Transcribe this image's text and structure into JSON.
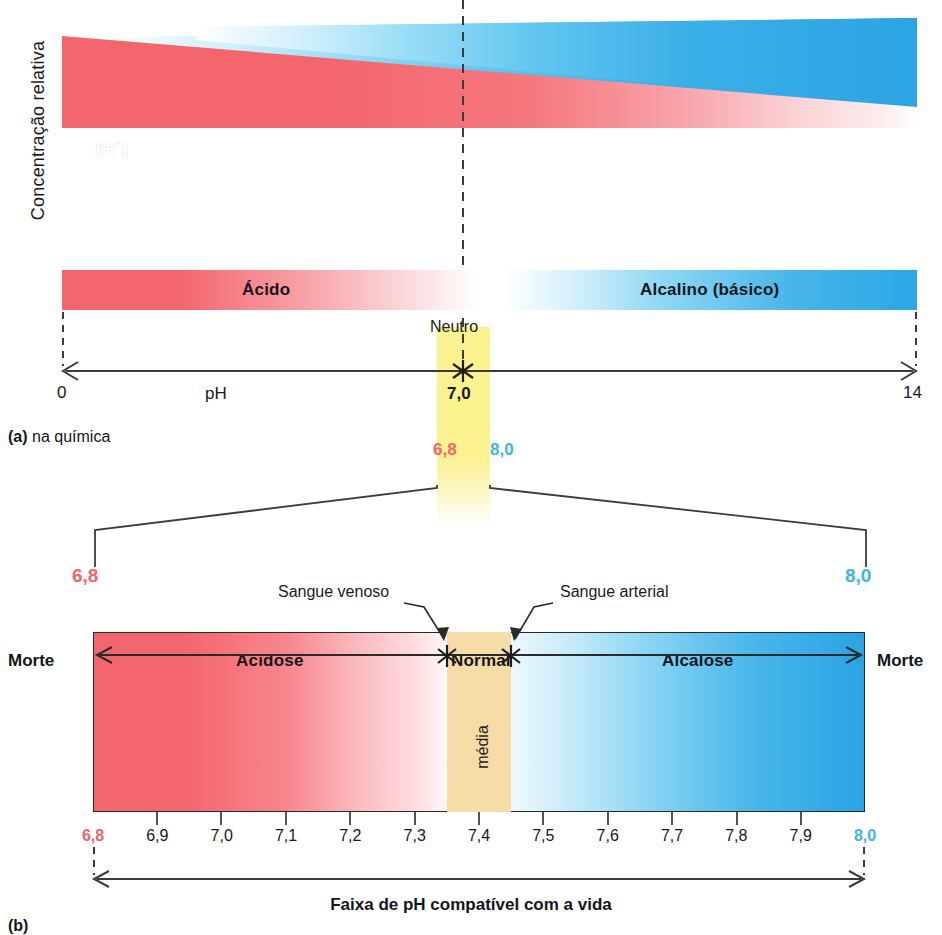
{
  "figure": {
    "y_axis_label": "Concentração relativa",
    "panel_a": {
      "caption_marker": "(a)",
      "caption_text": "na química",
      "ion_acid": "[H",
      "ion_acid_sup": "+",
      "ion_acid_close": "]",
      "ion_base": "[OH",
      "ion_base_sup": "−",
      "ion_base_close": "]",
      "band_acid": "Ácido",
      "band_alkaline": "Alcalino (básico)",
      "neutral_label": "Neutro",
      "axis_name": "pH",
      "axis_min": "0",
      "axis_max": "14",
      "neutral_value": "7,0",
      "callout_low": "6,8",
      "callout_high": "8,0"
    },
    "panel_b": {
      "caption_marker": "(b)",
      "expand_low": "6,8",
      "expand_high": "8,0",
      "label_venous": "Sangue venoso",
      "label_arterial": "Sangue arterial",
      "zone_acidosis": "Acidose",
      "zone_normal": "Normal",
      "zone_alkalosis": "Alcalose",
      "mean_label": "média",
      "death_left": "Morte",
      "death_right": "Morte",
      "range_caption": "Faixa de pH compatível com a vida",
      "scale_min": "6,8",
      "scale_max": "8,0",
      "scale_ticks": [
        "6,8",
        "6,9",
        "7,0",
        "7,1",
        "7,2",
        "7,3",
        "7,4",
        "7,5",
        "7,6",
        "7,7",
        "7,8",
        "7,9",
        "8,0"
      ]
    }
  },
  "colors": {
    "acid_red": "#f4666e",
    "alkaline_blue": "#2ba4e4",
    "neutral_white": "#ffffff",
    "highlight_yellow": "#fcf28f",
    "normal_band": "#f6dda8",
    "label_red": "#f4626c",
    "label_blue": "#3fb3e8",
    "line": "#2a2a2a"
  },
  "chart_data": {
    "type": "area",
    "xlabel": "pH",
    "ylabel": "Concentração relativa",
    "xlim": [
      0,
      14
    ],
    "grid": false,
    "legend": [
      "[H+]",
      "[OH-]"
    ],
    "series": [
      {
        "name": "[H+]",
        "x": [
          0,
          14
        ],
        "values": [
          100,
          8
        ],
        "color": "#f4666e",
        "note": "cunha vermelha decrescente: concentração de íons hidrogênio cai conforme o pH sobe"
      },
      {
        "name": "[OH-]",
        "x": [
          0,
          14
        ],
        "values": [
          8,
          100
        ],
        "color": "#2ba4e4",
        "note": "cunha azul crescente: concentração de íons hidroxila sobe conforme o pH sobe"
      }
    ],
    "annotations": [
      {
        "text": "Neutro",
        "x": 7.0
      },
      {
        "text": "Ácido",
        "x_range": [
          0,
          7
        ]
      },
      {
        "text": "Alcalino (básico)",
        "x_range": [
          7,
          14
        ]
      },
      {
        "text": "6,8",
        "x": 6.8
      },
      {
        "text": "8,0",
        "x": 8.0
      }
    ],
    "subplot_b": {
      "type": "area",
      "xlabel": "pH",
      "xlim": [
        6.8,
        8.0
      ],
      "tick_step": 0.1,
      "ticks": [
        6.8,
        6.9,
        7.0,
        7.1,
        7.2,
        7.3,
        7.4,
        7.5,
        7.6,
        7.7,
        7.8,
        7.9,
        8.0
      ],
      "regions": [
        {
          "label": "Acidose",
          "range": [
            6.8,
            7.35
          ],
          "color": "#f4666e"
        },
        {
          "label": "Normal",
          "range": [
            7.35,
            7.45
          ],
          "color": "#f6dda8"
        },
        {
          "label": "Alcalose",
          "range": [
            7.45,
            8.0
          ],
          "color": "#2ba4e4"
        }
      ],
      "markers": [
        {
          "label": "Sangue venoso",
          "x": 7.35
        },
        {
          "label": "Sangue arterial",
          "x": 7.45
        }
      ],
      "endpoints": [
        {
          "label": "Morte",
          "x": 6.8
        },
        {
          "label": "Morte",
          "x": 8.0
        }
      ],
      "span_caption": "Faixa de pH compatível com a vida",
      "mean_marker": "média"
    }
  }
}
